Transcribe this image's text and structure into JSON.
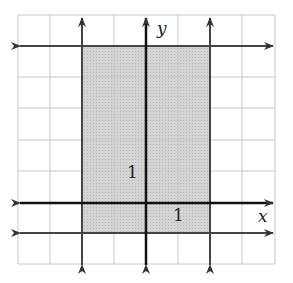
{
  "diagram": {
    "type": "coordinate-grid-inequality",
    "axis_labels": {
      "x": "x",
      "y": "y"
    },
    "tick_labels": {
      "x_unit": "1",
      "y_unit": "1"
    },
    "grid": {
      "x_range": [
        -4,
        4
      ],
      "y_range": [
        -2,
        6
      ]
    },
    "boundary_lines": [
      {
        "equation": "x = -2",
        "style": "solid"
      },
      {
        "equation": "x = 2",
        "style": "solid"
      },
      {
        "equation": "y = 5",
        "style": "solid"
      },
      {
        "equation": "y = -1",
        "style": "solid"
      }
    ],
    "shaded_region": "-2 <= x <= 2, -1 <= y <= 5",
    "colors": {
      "shade": "#cfcfcf",
      "grid": "#c8c8c8",
      "line": "#333333"
    }
  }
}
